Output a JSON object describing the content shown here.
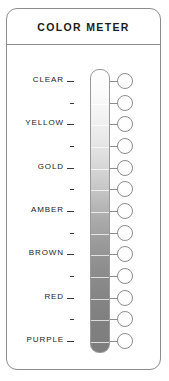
{
  "panel": {
    "title": "COLOR METER"
  },
  "meter": {
    "scale_top_color": "#ffffff",
    "scale_bottom_color": "#7d7d7d",
    "rows": [
      {
        "label": "CLEAR",
        "labeled": true
      },
      {
        "label": "",
        "labeled": false
      },
      {
        "label": "YELLOW",
        "labeled": true
      },
      {
        "label": "",
        "labeled": false
      },
      {
        "label": "GOLD",
        "labeled": true
      },
      {
        "label": "",
        "labeled": false
      },
      {
        "label": "AMBER",
        "labeled": true
      },
      {
        "label": "",
        "labeled": false
      },
      {
        "label": "BROWN",
        "labeled": true
      },
      {
        "label": "",
        "labeled": false
      },
      {
        "label": "RED",
        "labeled": true
      },
      {
        "label": "",
        "labeled": false
      },
      {
        "label": "PURPLE",
        "labeled": true
      }
    ]
  }
}
